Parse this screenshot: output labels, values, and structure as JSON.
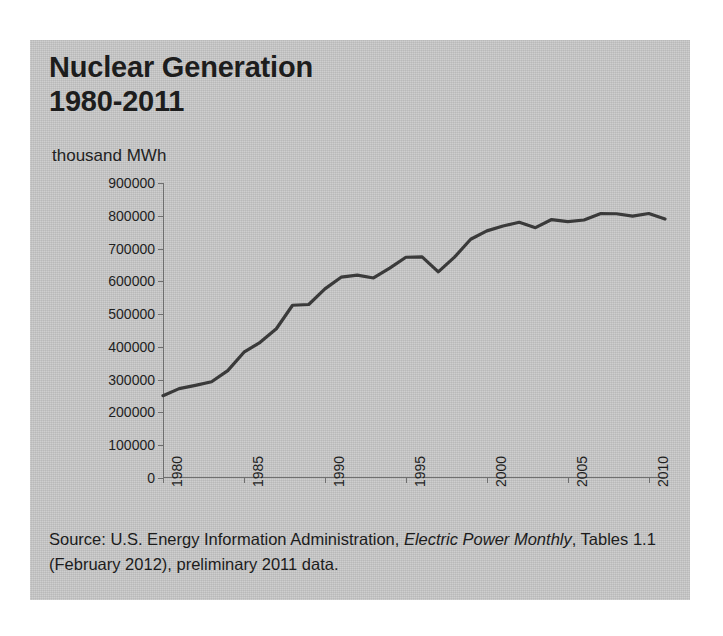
{
  "figure": {
    "title_line1": "Nuclear Generation",
    "title_line2": "1980-2011",
    "unit_label": "thousand MWh",
    "source_prefix": "Source: U.S. Energy Information Administration, ",
    "source_italic1": "Electric Power Monthly",
    "source_suffix": ", Tables 1.1 (February 2012), preliminary  2011 data.",
    "background_color": "#c9c9c9",
    "line_color": "#3a3a3a",
    "axis_color": "#6f6f6f",
    "text_color": "#1d1d1d"
  },
  "chart_data": {
    "type": "line",
    "title": "Nuclear Generation 1980-2011",
    "xlabel": "",
    "ylabel": "thousand MWh",
    "xlim": [
      1980,
      2011
    ],
    "ylim": [
      0,
      900000
    ],
    "grid": false,
    "legend": "none",
    "ytick_labels": [
      "900000",
      "800000",
      "700000",
      "600000",
      "500000",
      "400000",
      "300000",
      "200000",
      "100000",
      "0"
    ],
    "ytick_values": [
      900000,
      800000,
      700000,
      600000,
      500000,
      400000,
      300000,
      200000,
      100000,
      0
    ],
    "xtick_labels": [
      "1980",
      "1985",
      "1990",
      "1995",
      "2000",
      "2005",
      "2010"
    ],
    "xtick_values": [
      1980,
      1985,
      1990,
      1995,
      2000,
      2005,
      2010
    ],
    "series": [
      {
        "name": "Nuclear Generation",
        "x": [
          1980,
          1981,
          1982,
          1983,
          1984,
          1985,
          1986,
          1987,
          1988,
          1989,
          1990,
          1991,
          1992,
          1993,
          1994,
          1995,
          1996,
          1997,
          1998,
          1999,
          2000,
          2001,
          2002,
          2003,
          2004,
          2005,
          2006,
          2007,
          2008,
          2009,
          2010,
          2011
        ],
        "values": [
          251116,
          272674,
          282773,
          293677,
          327634,
          383691,
          414038,
          455270,
          526973,
          529355,
          576862,
          612565,
          618776,
          610291,
          640440,
          673402,
          674729,
          628644,
          673702,
          728254,
          753893,
          768826,
          780064,
          763733,
          788528,
          781986,
          787219,
          806425,
          806208,
          798855,
          806968,
          790204
        ]
      }
    ]
  }
}
